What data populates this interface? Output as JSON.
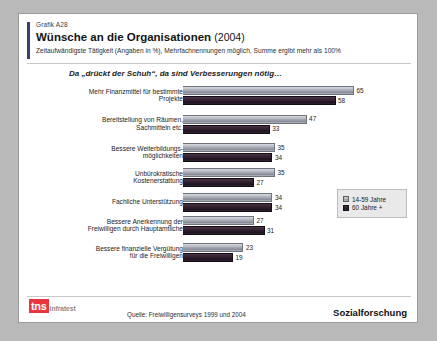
{
  "header": {
    "graph_id": "Grafik A28",
    "title": "Wünsche an die Organisationen",
    "year": "(2004)",
    "subtitle": "Zeitaufwändigste Tätigkeit (Angaben in %), Mehrfachnennungen möglich, Summe ergibt mehr als 100%"
  },
  "leadin": "Da „drückt der Schuh“, da sind Verbesserungen nötig…",
  "legend": {
    "items": [
      {
        "label": "14-59 Jahre",
        "color": "#a3a7b0"
      },
      {
        "label": "60 Jahre +",
        "color": "#2a1a28"
      }
    ]
  },
  "footer": {
    "logo_mark": "tns",
    "logo_word": "infratest",
    "source": "Quelle: Freiwilligensurveys 1999 und 2004",
    "division": "Sozialforschung"
  },
  "chart_data": {
    "type": "bar",
    "orientation": "horizontal",
    "title": "Wünsche an die Organisationen (2004)",
    "subtitle": "Zeitaufwändigste Tätigkeit (Angaben in %), Mehrfachnennungen möglich, Summe ergibt mehr als 100%",
    "xlabel": "",
    "ylabel": "",
    "xlim": [
      0,
      65
    ],
    "grid": false,
    "legend_position": "bottom-right",
    "categories": [
      "Mehr Finanzmittel für bestimmte Projekte",
      "Bereitstellung von Räumen, Sachmitteln etc.",
      "Bessere Weiterbildungs-möglichkeiten",
      "Unbürokratische Kostenerstattung",
      "Fachliche Unterstützung",
      "Bessere Anerkennung der Freiwilligen durch Hauptamtliche",
      "Bessere finanzielle Vergütung für die Freiwilligen"
    ],
    "category_lines": [
      [
        "Mehr Finanzmittel für bestimmte",
        "Projekte"
      ],
      [
        "Bereitstellung von Räumen,",
        "Sachmitteln etc."
      ],
      [
        "Bessere Weiterbildungs-",
        "möglichkeiten"
      ],
      [
        "Unbürokratische",
        "Kostenerstattung"
      ],
      [
        "Fachliche Unterstützung"
      ],
      [
        "Bessere Anerkennung der",
        "Freiwilligen durch Hauptamtliche"
      ],
      [
        "Bessere finanzielle Vergütung",
        "für die Freiwilligen"
      ]
    ],
    "series": [
      {
        "name": "14-59 Jahre",
        "values": [
          65,
          47,
          35,
          35,
          34,
          27,
          23
        ]
      },
      {
        "name": "60 Jahre +",
        "values": [
          58,
          33,
          34,
          27,
          34,
          31,
          19
        ]
      }
    ]
  }
}
